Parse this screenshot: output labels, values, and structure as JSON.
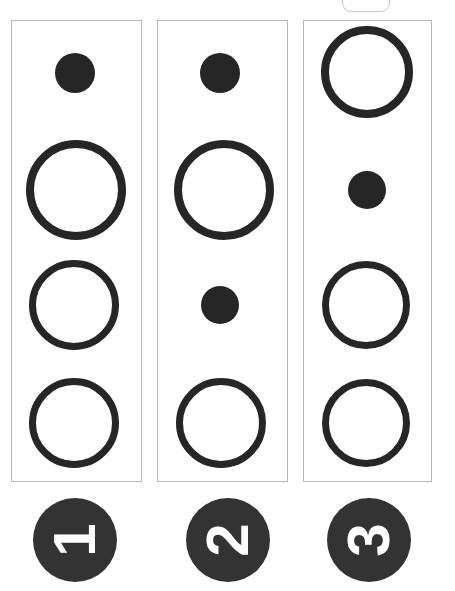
{
  "canvas": {
    "width": 455,
    "height": 591,
    "background": "#ffffff",
    "ink_color": "#262626",
    "badge_color": "#333333",
    "panel_border_color": "#b9b9b9"
  },
  "top_tab": {
    "name": "clipped-rounded-tab",
    "x": 342,
    "y": -14,
    "width": 48,
    "height": 26,
    "border_color": "#c9c9c9"
  },
  "panels": [
    {
      "id": "panel-1",
      "x": 11,
      "y": 20,
      "width": 131,
      "height": 462,
      "marks": [
        {
          "id": "p1-m1",
          "shape": "filled-circle",
          "cx": 75,
          "cy": 73,
          "d": 40
        },
        {
          "id": "p1-m2",
          "shape": "open-circle",
          "cx": 76,
          "cy": 190,
          "d": 100,
          "stroke": 8
        },
        {
          "id": "p1-m3",
          "shape": "open-circle",
          "cx": 74,
          "cy": 305,
          "d": 90,
          "stroke": 7
        },
        {
          "id": "p1-m4",
          "shape": "open-circle",
          "cx": 74,
          "cy": 423,
          "d": 90,
          "stroke": 7
        }
      ]
    },
    {
      "id": "panel-2",
      "x": 157,
      "y": 20,
      "width": 131,
      "height": 462,
      "marks": [
        {
          "id": "p2-m1",
          "shape": "filled-circle",
          "cx": 220,
          "cy": 73,
          "d": 40
        },
        {
          "id": "p2-m2",
          "shape": "open-circle",
          "cx": 224,
          "cy": 190,
          "d": 100,
          "stroke": 8
        },
        {
          "id": "p2-m3",
          "shape": "filled-circle",
          "cx": 220,
          "cy": 305,
          "d": 38
        },
        {
          "id": "p2-m4",
          "shape": "open-circle",
          "cx": 221,
          "cy": 423,
          "d": 90,
          "stroke": 7
        }
      ]
    },
    {
      "id": "panel-3",
      "x": 303,
      "y": 20,
      "width": 129,
      "height": 462,
      "marks": [
        {
          "id": "p3-m1",
          "shape": "open-circle",
          "cx": 367,
          "cy": 72,
          "d": 92,
          "stroke": 8
        },
        {
          "id": "p3-m2",
          "shape": "filled-circle",
          "cx": 367,
          "cy": 190,
          "d": 38
        },
        {
          "id": "p3-m3",
          "shape": "open-circle",
          "cx": 366,
          "cy": 305,
          "d": 88,
          "stroke": 7
        },
        {
          "id": "p3-m4",
          "shape": "open-circle",
          "cx": 366,
          "cy": 423,
          "d": 88,
          "stroke": 7
        }
      ]
    }
  ],
  "badges": [
    {
      "id": "badge-1",
      "label": "1",
      "cx": 75,
      "cy": 540,
      "d": 84,
      "rotation_deg": -90
    },
    {
      "id": "badge-2",
      "label": "2",
      "cx": 228,
      "cy": 540,
      "d": 84,
      "rotation_deg": -90
    },
    {
      "id": "badge-3",
      "label": "3",
      "cx": 369,
      "cy": 540,
      "d": 84,
      "rotation_deg": -90
    }
  ]
}
